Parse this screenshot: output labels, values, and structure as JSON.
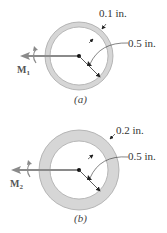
{
  "figures": [
    {
      "id": "a",
      "caption": "(a)",
      "moment_label": "M",
      "moment_sub": "1",
      "thickness_label": "0.1 in.",
      "radius_label": "0.5 in."
    },
    {
      "id": "b",
      "caption": "(b)",
      "moment_label": "M",
      "moment_sub": "2",
      "thickness_label": "0.2 in.",
      "radius_label": "0.5 in."
    }
  ],
  "colors": {
    "ring_fill": "#d9d9d9",
    "ring_stroke": "#a6a6a6",
    "arrow": "#8c8c8c",
    "line": "#333333"
  }
}
